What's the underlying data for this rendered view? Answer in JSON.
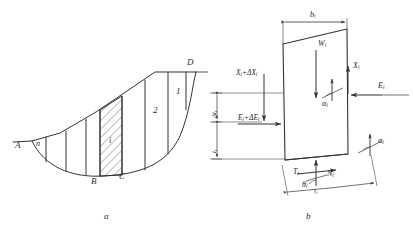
{
  "figure": {
    "kind": "slope-stability-method-of-slices",
    "line_color": "#333333",
    "hatch_color": "#555555",
    "background": "#ffffff",
    "captions": {
      "panel_a": "a",
      "panel_b": "b"
    }
  },
  "panel_a": {
    "name": "sliding-mass-divided-into-slices",
    "points": {
      "A": "A",
      "B": "B",
      "C": "C",
      "D": "D"
    },
    "slice_numbers": {
      "first": "1",
      "second": "2",
      "generic": "i",
      "last": "n"
    }
  },
  "panel_b": {
    "name": "forces-on-single-slice",
    "labels": {
      "width": "b",
      "width_sub": "i",
      "weight": "W",
      "weight_sub": "i",
      "interslice_shear_right": "X",
      "interslice_shear_right_sub": "i",
      "interslice_normal_right": "E",
      "interslice_normal_right_sub": "i",
      "interslice_shear_left": "X",
      "interslice_shear_left_sub": "i",
      "interslice_shear_left_delta": "+ΔX",
      "interslice_shear_left_delta_sub": "i",
      "interslice_normal_left": "E",
      "interslice_normal_left_sub": "i",
      "interslice_normal_left_delta": "+ΔE",
      "interslice_normal_left_delta_sub": "i",
      "base_shear": "T",
      "base_shear_sub": "i",
      "base_normal": "N",
      "base_normal_sub": "i",
      "base_angle": "θ",
      "base_angle_sub": "i",
      "base_length": "l",
      "base_length_sub": "i",
      "thrust_angle_upper": "α",
      "thrust_angle_upper_sub": "i",
      "thrust_angle_lower": "α",
      "thrust_angle_lower_sub": "i",
      "height_lower": "t",
      "height_lower_sub": "i",
      "height_delta": "Δt",
      "height_delta_sub": "i"
    }
  }
}
